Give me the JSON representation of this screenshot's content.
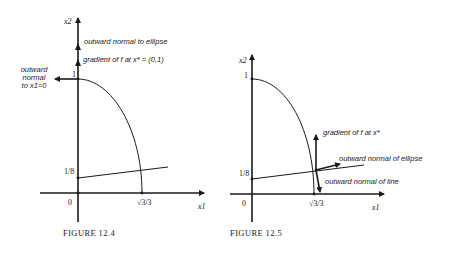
{
  "figures": [
    {
      "caption": "FIGURE 12.4",
      "axes": {
        "x_label": "x1",
        "y_label": "x2",
        "origin_label": "0",
        "y_tick": "1",
        "x_tick": "√3/3",
        "y_intercept_label": "1/8"
      },
      "annotations": {
        "top": "outward normal to ellipse",
        "middle": "gradient of f at x* = (0,1)",
        "left_line1": "outward",
        "left_line2": "normal",
        "left_line3": "to x1=0"
      }
    },
    {
      "caption": "FIGURE 12.5",
      "axes": {
        "x_label": "x1",
        "y_label": "x2",
        "origin_label": "0",
        "y_tick": "1",
        "x_tick": "√3/3",
        "y_intercept_label": "1/8"
      },
      "annotations": {
        "gradient": "gradient of f at x*",
        "ellipse_normal": "outward normal of ellipse",
        "line_normal": "outward normal of line"
      }
    }
  ],
  "colors": {
    "ink": "#1a1a1a",
    "background": "#ffffff"
  }
}
